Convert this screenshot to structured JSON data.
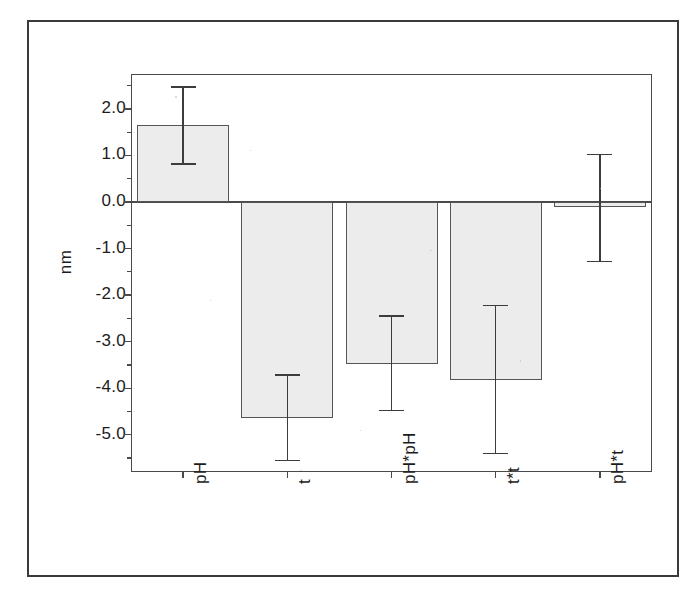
{
  "figure": {
    "border_color": "#3a3a3a",
    "background": "#ffffff"
  },
  "chart_data": {
    "type": "bar",
    "title": "",
    "subtitle": "",
    "xlabel": "",
    "ylabel": "nm",
    "categories": [
      "pH",
      "t",
      "pH*pH",
      "t*t",
      "pH*t"
    ],
    "values": [
      1.65,
      -4.65,
      -3.47,
      -3.82,
      -0.1
    ],
    "errors_low": [
      0.82,
      -5.55,
      -4.48,
      -5.4,
      -1.28
    ],
    "errors_high": [
      2.47,
      -3.72,
      -2.45,
      -2.22,
      1.02
    ],
    "error_magnitudes": [
      0.83,
      0.9,
      1.02,
      1.6,
      1.15
    ],
    "ylim": [
      -5.8,
      2.75
    ],
    "ytick_values": [
      2.0,
      1.0,
      0.0,
      -1.0,
      -2.0,
      -3.0,
      -4.0,
      -5.0
    ],
    "ytick_labels": [
      "2.0",
      "1.0",
      "0.0",
      "-1.0",
      "-2.0",
      "-3.0",
      "-4.0",
      "-5.0"
    ],
    "minor_ticks": true,
    "grid": false,
    "legend": "none",
    "bar_fill_color": "#ececec",
    "bar_edge_color": "#555555",
    "error_bar_color": "#3c3c3c",
    "axis_color": "#4a4a4a",
    "text_color": "#1c1c1c"
  }
}
